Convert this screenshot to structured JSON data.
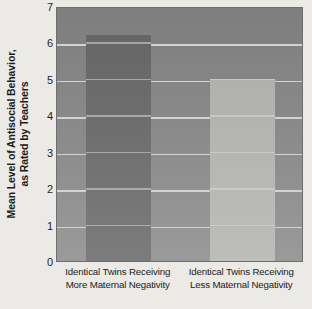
{
  "chart_data": {
    "type": "bar",
    "title": "",
    "xlabel": "",
    "ylabel": "Mean Level of Antisocial Behavior, as Rated by Teachers",
    "ylabel_lines": [
      "Mean Level of Antisocial Behavior,",
      "as Rated by Teachers"
    ],
    "categories": [
      "Identical Twins Receiving More Maternal Negativity",
      "Identical Twins Receiving Less Maternal Negativity"
    ],
    "category_lines": [
      [
        "Identical Twins Receiving",
        "More Maternal Negativity"
      ],
      [
        "Identical Twins Receiving",
        "Less Maternal Negativity"
      ]
    ],
    "values": [
      6.2,
      5.0
    ],
    "ylim": [
      0,
      7
    ],
    "yticks": [
      0,
      1,
      2,
      3,
      4,
      5,
      6,
      7
    ],
    "ytick_labels": [
      "0",
      "1",
      "2",
      "3",
      "4",
      "5",
      "6",
      "7"
    ],
    "grid": true,
    "grid_axis": "y",
    "legend": "none",
    "colors": {
      "bar_more": "#6e6e6e",
      "bar_less": "#b6b6b3",
      "plot_background": "#898989",
      "gridline": "#d9d9d6",
      "page_background": "#eceae6",
      "text": "#1b1b1b"
    }
  }
}
